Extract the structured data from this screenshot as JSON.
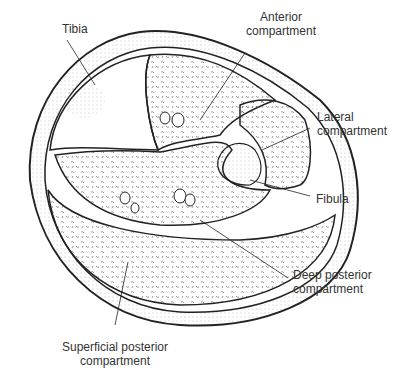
{
  "labels": {
    "tibia": "Tibia",
    "anterior_line1": "Anterior",
    "anterior_line2": "compartment",
    "lateral_line1": "Lateral",
    "lateral_line2": "compartment",
    "fibula": "Fibula",
    "deep_line1": "Deep posterior",
    "deep_line2": "compartment",
    "superficial_line1": "Superficial posterior",
    "superficial_line2": "compartment"
  }
}
